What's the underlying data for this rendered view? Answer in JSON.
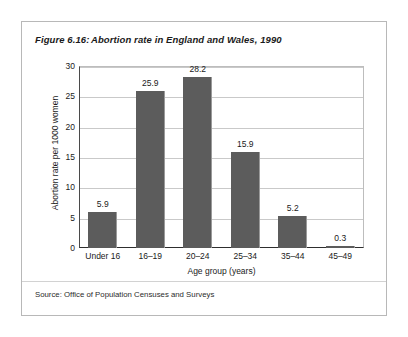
{
  "figure": {
    "number_label": "Figure 6.16:",
    "title": "Abortion rate in England and Wales, 1990",
    "source": "Source: Office of Population Censuses and Surveys"
  },
  "chart_data": {
    "type": "bar",
    "title": "Abortion rate in England and Wales, 1990",
    "categories": [
      "Under 16",
      "16–19",
      "20–24",
      "25–34",
      "35–44",
      "45–49"
    ],
    "values": [
      5.9,
      25.9,
      28.2,
      15.9,
      5.2,
      0.3
    ],
    "value_labels": [
      "5.9",
      "25.9",
      "28.2",
      "15.9",
      "5.2",
      "0.3"
    ],
    "xlabel": "Age group (years)",
    "ylabel": "Abortion rate per 1000 women",
    "ylim": [
      0,
      30
    ],
    "ytick_labels": [
      "0",
      "5",
      "10",
      "15",
      "20",
      "25",
      "30"
    ],
    "ytick_values": [
      0,
      5,
      10,
      15,
      20,
      25,
      30
    ],
    "grid": true,
    "legend": false,
    "bar_color": "#5c5c5c",
    "gridline_color": "#c9c9c9",
    "axis_color": "#2e2e2e"
  }
}
